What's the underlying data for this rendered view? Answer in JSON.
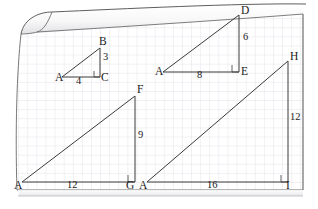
{
  "figure": {
    "paper": {
      "grid_color": "#d8d4dc",
      "grid_spacing_px": 9.1,
      "edge_color": "#6a6a6a",
      "background": "#ffffff"
    },
    "line_color": "#3a3a3a",
    "label_color": "#1a1a1a"
  },
  "triangles": [
    {
      "name": "ABC",
      "vertices": [
        {
          "label": "A",
          "x": 62,
          "y": 77
        },
        {
          "label": "B",
          "x": 100,
          "y": 48
        },
        {
          "label": "C",
          "x": 100,
          "y": 77
        }
      ],
      "legs": [
        {
          "label": "4",
          "side": "base",
          "x": 78,
          "y": 84
        },
        {
          "label": "3",
          "side": "height",
          "x": 104,
          "y": 62
        }
      ],
      "right_angle_at": "C"
    },
    {
      "name": "ADE",
      "vertices": [
        {
          "label": "A",
          "x": 163,
          "y": 72
        },
        {
          "label": "D",
          "x": 239,
          "y": 15
        },
        {
          "label": "E",
          "x": 239,
          "y": 72
        }
      ],
      "legs": [
        {
          "label": "8",
          "side": "base",
          "x": 198,
          "y": 79
        },
        {
          "label": "6",
          "side": "height",
          "x": 244,
          "y": 44
        }
      ],
      "right_angle_at": "E"
    },
    {
      "name": "AFG",
      "vertices": [
        {
          "label": "A",
          "x": 22,
          "y": 182
        },
        {
          "label": "F",
          "x": 135,
          "y": 96
        },
        {
          "label": "G",
          "x": 135,
          "y": 182
        }
      ],
      "legs": [
        {
          "label": "12",
          "side": "base",
          "x": 74,
          "y": 190
        },
        {
          "label": "9",
          "side": "height",
          "x": 140,
          "y": 140
        }
      ],
      "right_angle_at": "G"
    },
    {
      "name": "AHI",
      "vertices": [
        {
          "label": "A",
          "x": 147,
          "y": 182
        },
        {
          "label": "H",
          "x": 288,
          "y": 61
        },
        {
          "label": "I",
          "x": 288,
          "y": 182
        }
      ],
      "legs": [
        {
          "label": "16",
          "side": "base",
          "x": 215,
          "y": 190
        },
        {
          "label": "12",
          "side": "height",
          "x": 293,
          "y": 122
        }
      ],
      "right_angle_at": "I"
    }
  ],
  "vertex_labels": [
    {
      "id": "abc-A",
      "text": "A",
      "left": 55,
      "top": 74
    },
    {
      "id": "abc-B",
      "text": "B",
      "left": 100,
      "top": 38
    },
    {
      "id": "abc-C",
      "text": "C",
      "left": 101,
      "top": 74
    },
    {
      "id": "ade-A",
      "text": "A",
      "left": 155,
      "top": 65
    },
    {
      "id": "ade-D",
      "text": "D",
      "left": 241,
      "top": 6
    },
    {
      "id": "ade-E",
      "text": "E",
      "left": 241,
      "top": 65
    },
    {
      "id": "afg-A",
      "text": "A",
      "left": 15,
      "top": 180
    },
    {
      "id": "afg-F",
      "text": "F",
      "left": 137,
      "top": 85
    },
    {
      "id": "afg-G",
      "text": "G",
      "left": 127,
      "top": 180
    },
    {
      "id": "ahi-A",
      "text": "A",
      "left": 141,
      "top": 180
    },
    {
      "id": "ahi-H",
      "text": "H",
      "left": 290,
      "top": 52
    },
    {
      "id": "ahi-I",
      "text": "I",
      "left": 288,
      "top": 180
    }
  ],
  "measure_labels": [
    {
      "id": "abc-base",
      "text": "4",
      "left": 76,
      "top": 76
    },
    {
      "id": "abc-height",
      "text": "3",
      "left": 103,
      "top": 53
    },
    {
      "id": "ade-base",
      "text": "8",
      "left": 196,
      "top": 70
    },
    {
      "id": "ade-height",
      "text": "6",
      "left": 243,
      "top": 33
    },
    {
      "id": "afg-base",
      "text": "12",
      "left": 68,
      "top": 180
    },
    {
      "id": "afg-height",
      "text": "9",
      "left": 139,
      "top": 130
    },
    {
      "id": "ahi-base",
      "text": "16",
      "left": 209,
      "top": 180
    },
    {
      "id": "ahi-height",
      "text": "12",
      "left": 291,
      "top": 113
    }
  ]
}
